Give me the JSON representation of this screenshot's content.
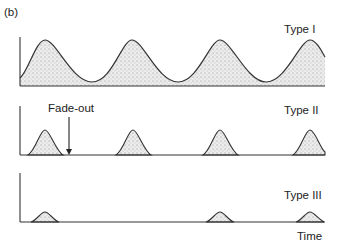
{
  "figure": {
    "panel_label": "(b)",
    "panels": [
      {
        "name": "Type I",
        "label": "Type I",
        "description": "Regular, large sustained oscillations with high troughs"
      },
      {
        "name": "Type II",
        "label": "Type II",
        "annotation": "Fade-out",
        "description": "Periodic epidemics with fade-out between peaks"
      },
      {
        "name": "Type III",
        "label": "Type III",
        "description": "Sporadic small irregular outbreaks"
      }
    ],
    "x_axis_label": "Time"
  },
  "colors": {
    "line": "#333333",
    "fill": "#d9d9d9",
    "background": "#ffffff"
  }
}
